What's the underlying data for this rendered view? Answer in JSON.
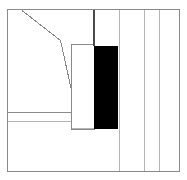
{
  "document": {
    "title": "Technical Line Drawing",
    "kind": "line-drawing",
    "width": 187,
    "height": 180,
    "background_color": "#ffffff"
  },
  "palette": {
    "outline": "#8a8a8a",
    "outline_dark": "#4a4a4a",
    "fill_black": "#000000",
    "fill_white": "#ffffff",
    "light_rule": "#b5b5b5"
  },
  "geometry": {
    "outer_frame": {
      "label": "outer-frame",
      "x": 7.5,
      "y": 9.5,
      "width": 172,
      "height": 161.5,
      "stroke": "#8a8a8a",
      "stroke_width": 1,
      "fill": "none"
    },
    "black_block": {
      "label": "black-block",
      "x": 94,
      "y": 45.5,
      "width": 23.5,
      "height": 83.5,
      "fill": "#000000"
    },
    "inner_panel": {
      "label": "inner-panel",
      "x": 71.5,
      "y": 44.5,
      "width": 23,
      "height": 84.5,
      "stroke": "#8a8a8a",
      "stroke_width": 1,
      "fill": "#ffffff"
    },
    "vertical_rules": [
      {
        "label": "rule-top-dark",
        "x": 94,
        "y1": 9.5,
        "y2": 45.5,
        "stroke": "#4a4a4a",
        "stroke_width": 1.4
      },
      {
        "label": "rule-1",
        "x": 119.5,
        "y1": 9.5,
        "y2": 171,
        "stroke": "#b5b5b5",
        "stroke_width": 1.2
      },
      {
        "label": "rule-2",
        "x": 144.5,
        "y1": 9.5,
        "y2": 171,
        "stroke": "#b5b5b5",
        "stroke_width": 1.2
      },
      {
        "label": "rule-3",
        "x": 159.5,
        "y1": 9.5,
        "y2": 171,
        "stroke": "#b5b5b5",
        "stroke_width": 1.2
      }
    ],
    "horizontal_rules": [
      {
        "label": "h-rule-upper",
        "y": 112.5,
        "x1": 7.5,
        "x2": 80,
        "stroke": "#8a8a8a",
        "stroke_width": 1
      },
      {
        "label": "h-rule-lower",
        "y": 121.5,
        "x1": 7.5,
        "x2": 80,
        "stroke": "#b5b5b5",
        "stroke_width": 1.2
      }
    ],
    "diagonal_polyline": {
      "label": "diagonal-polyline",
      "points": "22,10.5 60.5,40.5 78.5,122",
      "stroke": "#8a8a8a",
      "stroke_width": 1,
      "fill": "none"
    },
    "diagonal_closers": [
      {
        "label": "closer-upper",
        "x1": 78.5,
        "y1": 122,
        "x2": 71.5,
        "y2": 112.5,
        "stroke": "#8a8a8a",
        "stroke_width": 1
      },
      {
        "label": "closer-lower",
        "x1": 78.5,
        "y1": 122,
        "x2": 71.5,
        "y2": 122,
        "stroke": "#b5b5b5",
        "stroke_width": 1
      }
    ],
    "panel_base": {
      "label": "panel-base",
      "x1": 71.5,
      "y1": 128.5,
      "x2": 94,
      "y2": 128.5,
      "stroke": "#b5b5b5",
      "stroke_width": 1.6
    }
  }
}
